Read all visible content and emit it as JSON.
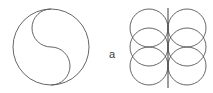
{
  "figure": {
    "background_color": "#ffffff",
    "stroke_color": "#555555",
    "stroke_color_dark": "#3a3a3a",
    "label": {
      "text": "a",
      "x": 112,
      "y": 55
    },
    "left_diagram": {
      "name": "circle-with-s-curve",
      "description": "Outer circle divided by an S-shaped curve formed of two semicircles",
      "center_x": 51,
      "center_y": 47,
      "radius": 38,
      "upper_semicircle_center_x": 51,
      "upper_semicircle_center_y": 28,
      "lower_semicircle_center_x": 51,
      "lower_semicircle_center_y": 66,
      "semicircle_radius": 19
    },
    "right_diagram": {
      "name": "overlapping-circle-grid",
      "description": "Six overlapping circles arranged in two columns by three rows with a vertical centre axis",
      "columns": 2,
      "rows": 3,
      "circle_radius": 19,
      "column_centers_x": [
        149,
        187
      ],
      "row_centers_y": [
        28,
        47,
        66
      ],
      "axis_line": {
        "x": 168,
        "y_top": 8,
        "y_bottom": 88
      }
    }
  }
}
